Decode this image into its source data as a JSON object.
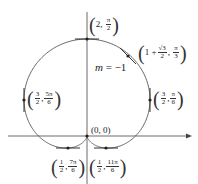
{
  "chart_data": {
    "type": "line",
    "title": "",
    "curve": "r = 1 + sin(theta)",
    "axes": {
      "x_axis_arrow": true,
      "y_axis": true
    },
    "annotation": "m = -1",
    "points": [
      {
        "r": "2",
        "theta": "π/2",
        "label": "(2, π/2)"
      },
      {
        "r": "1 + √3/2",
        "theta": "π/3",
        "label": "(1 + √3/2, π/3)"
      },
      {
        "r": "3/2",
        "theta": "π/6",
        "label": "(3/2, π/6)"
      },
      {
        "r": "3/2",
        "theta": "5π/6",
        "label": "(3/2, 5π/6)"
      },
      {
        "r": "0",
        "theta": "0",
        "label": "(0, 0)"
      },
      {
        "r": "1/2",
        "theta": "7π/6",
        "label": "(1/2, 7π/6)"
      },
      {
        "r": "1/2",
        "theta": "11π/6",
        "label": "(1/2, 11π/6)"
      }
    ],
    "tangents": [
      {
        "at": "(2, π/2)",
        "slope": "horizontal"
      },
      {
        "at": "(1 + √3/2, π/3)",
        "slope": "-1"
      },
      {
        "at": "(3/2, π/6)",
        "slope": "vertical"
      },
      {
        "at": "(3/2, 5π/6)",
        "slope": "vertical"
      },
      {
        "at": "(1/2, 7π/6)",
        "slope": "horizontal"
      },
      {
        "at": "(1/2, 11π/6)",
        "slope": "horizontal"
      }
    ]
  },
  "labels": {
    "top": {
      "a": "2",
      "num": "π",
      "den": "2"
    },
    "upper_right": {
      "a": "1 + ",
      "num1": "√3",
      "den1": "2",
      "num2": "π",
      "den2": "3"
    },
    "right": {
      "num1": "3",
      "den1": "2",
      "num2": "π",
      "den2": "6"
    },
    "left": {
      "num1": "3",
      "den1": "2",
      "num2": "5π",
      "den2": "6"
    },
    "origin": "(0, 0)",
    "bottom_left": {
      "num1": "1",
      "den1": "2",
      "num2": "7π",
      "den2": "6"
    },
    "bottom_right": {
      "num1": "1",
      "den1": "2",
      "num2": "11π",
      "den2": "6"
    },
    "slope": {
      "m": "m",
      "eq": " = −1"
    }
  },
  "colors": {
    "curve": "#555555",
    "axis": "#444444",
    "point": "#222222"
  }
}
